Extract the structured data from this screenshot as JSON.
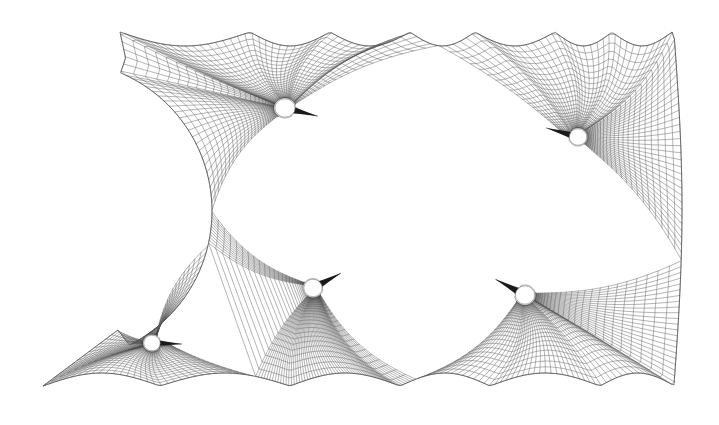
{
  "figure": {
    "type": "mesh-plot",
    "width": 719,
    "height": 425,
    "background_color": "#ffffff",
    "line_color": "#5a5a5a",
    "boundary_color": "#4a4a4a",
    "body_fill_color": "#ffffff",
    "body_outline_color": "#6a6a6a",
    "tail_color": "#1a1a1a"
  },
  "chart_data": {
    "type": "mesh",
    "title": "",
    "xlabel": "",
    "ylabel": "",
    "grid": false,
    "legend": "none",
    "axis_visible": false,
    "tick_labels": [],
    "domain_description": "Rectangular flow domain with scalloped top and bottom boundaries and a large concave circular cut-out on the left side; five embedded bodies each wrapped by a polar O-grid of radial and circumferential mesh lines.",
    "xlim": [
      0,
      719
    ],
    "ylim": [
      0,
      425
    ],
    "outer_boundary": {
      "top_peaks_x": [
        120,
        250,
        330,
        410,
        475,
        555,
        612,
        672
      ],
      "top_peak_y": 32,
      "top_sag_depth": 14,
      "bottom_peaks_x": [
        43,
        160,
        290,
        400,
        490,
        600,
        675
      ],
      "bottom_peak_y": 386,
      "bottom_sag_depth": 13,
      "left_notch": {
        "center_x": 62,
        "center_y": 211,
        "radius": 150,
        "rightmost_x": 210,
        "top_attach": [
          126,
          60
        ],
        "bottom_attach": [
          118,
          330
        ]
      },
      "right_edge_x": 674,
      "right_bulge": 8,
      "corner_top_left": [
        120,
        32
      ],
      "corner_top_right": [
        672,
        33
      ],
      "corner_bottom_left": [
        43,
        386
      ],
      "corner_bottom_right": [
        675,
        385
      ]
    },
    "bodies": [
      {
        "id": "body-1",
        "label": "airfoil-upper-left",
        "center": [
          285,
          108
        ],
        "radius_x": 11,
        "radius_y": 10,
        "tail_angle_deg": 14,
        "tail_length": 34,
        "tail_half_width": 4.2,
        "ring_count": 26,
        "spoke_count": 72,
        "far_radius": 150
      },
      {
        "id": "body-2",
        "label": "airfoil-upper-right",
        "center": [
          578,
          137
        ],
        "radius_x": 9.5,
        "radius_y": 9,
        "tail_angle_deg": 196,
        "tail_length": 33,
        "tail_half_width": 4.0,
        "ring_count": 25,
        "spoke_count": 68,
        "far_radius": 135
      },
      {
        "id": "body-3",
        "label": "airfoil-center-lower",
        "center": [
          313,
          288
        ],
        "radius_x": 10,
        "radius_y": 9.5,
        "tail_angle_deg": -28,
        "tail_length": 32,
        "tail_half_width": 4.2,
        "ring_count": 25,
        "spoke_count": 70,
        "far_radius": 140
      },
      {
        "id": "body-4",
        "label": "airfoil-lower-right",
        "center": [
          525,
          295
        ],
        "radius_x": 10.5,
        "radius_y": 10,
        "tail_angle_deg": 208,
        "tail_length": 34,
        "tail_half_width": 4.2,
        "ring_count": 25,
        "spoke_count": 68,
        "far_radius": 140
      },
      {
        "id": "body-5",
        "label": "airfoil-lower-left",
        "center": [
          152,
          343
        ],
        "radius_x": 9,
        "radius_y": 8.5,
        "tail_angle_deg": 2,
        "tail_length": 30,
        "tail_half_width": 3.6,
        "ring_count": 24,
        "spoke_count": 64,
        "far_radius": 125
      }
    ],
    "block_junctions": [
      [
        400,
        212
      ],
      [
        211,
        211
      ],
      [
        437,
        203
      ],
      [
        330,
        214
      ],
      [
        290,
        181
      ],
      [
        478,
        243
      ]
    ],
    "mesh_stats": {
      "body_count": 5,
      "block_count": 6,
      "radial_layers": 26,
      "circumferential_divisions": 72
    }
  }
}
